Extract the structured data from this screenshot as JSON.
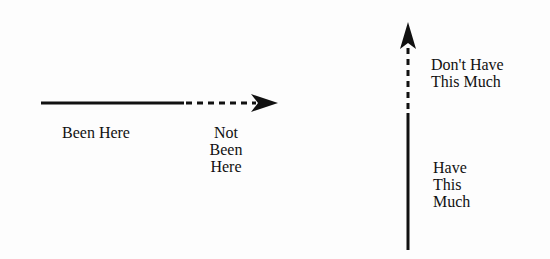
{
  "horizontal": {
    "known_label": "Been Here",
    "unknown_label": "Not\nBeen\nHere"
  },
  "vertical": {
    "unknown_label": "Don't Have\nThis Much",
    "known_label": "Have\nThis\nMuch"
  },
  "colors": {
    "ink": "#111111",
    "background": "#fdfdfd"
  }
}
